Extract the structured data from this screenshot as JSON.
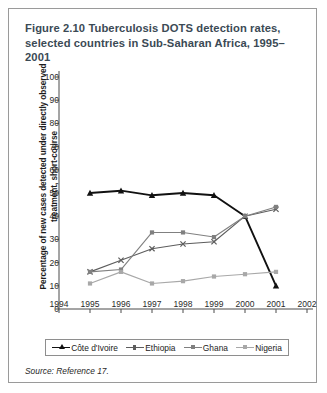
{
  "figure": {
    "title_line1": "Figure 2.10  Tuberculosis DOTS detection rates,",
    "title_line2": "selected countries in Sub-Saharan Africa, 1995–2001",
    "source": "Source: Reference 17."
  },
  "chart_data": {
    "type": "line",
    "title": "Figure 2.10  Tuberculosis DOTS detection rates, selected countries in Sub-Saharan Africa, 1995–2001",
    "xlabel": "",
    "ylabel": "Percentage of new cases detected under directly observed treatment, short-course",
    "x": [
      1995,
      1996,
      1997,
      1998,
      1999,
      2000,
      2001
    ],
    "xlim": [
      1994,
      2002
    ],
    "ylim": [
      0,
      100
    ],
    "xticks": [
      1994,
      1995,
      1996,
      1997,
      1998,
      1999,
      2000,
      2001,
      2002
    ],
    "yticks": [
      0,
      10,
      20,
      30,
      40,
      50,
      60,
      70,
      80,
      90,
      100
    ],
    "grid": false,
    "legend_position": "below",
    "series": [
      {
        "name": "Côte d'Ivoire",
        "color": "#111111",
        "marker": "triangle",
        "width": 1.9,
        "values": [
          50,
          51,
          49,
          50,
          49,
          40,
          10
        ]
      },
      {
        "name": "Ethiopia",
        "color": "#5d5d5d",
        "marker": "cross",
        "width": 1.1,
        "values": [
          16,
          21,
          26,
          28,
          29,
          40,
          43
        ]
      },
      {
        "name": "Ghana",
        "color": "#808080",
        "marker": "square",
        "width": 1.1,
        "values": [
          16,
          17,
          33,
          33,
          31,
          40,
          44
        ]
      },
      {
        "name": "Nigeria",
        "color": "#a8a8a8",
        "marker": "square",
        "width": 1.1,
        "values": [
          11,
          16,
          11,
          12,
          14,
          15,
          16
        ]
      }
    ]
  }
}
